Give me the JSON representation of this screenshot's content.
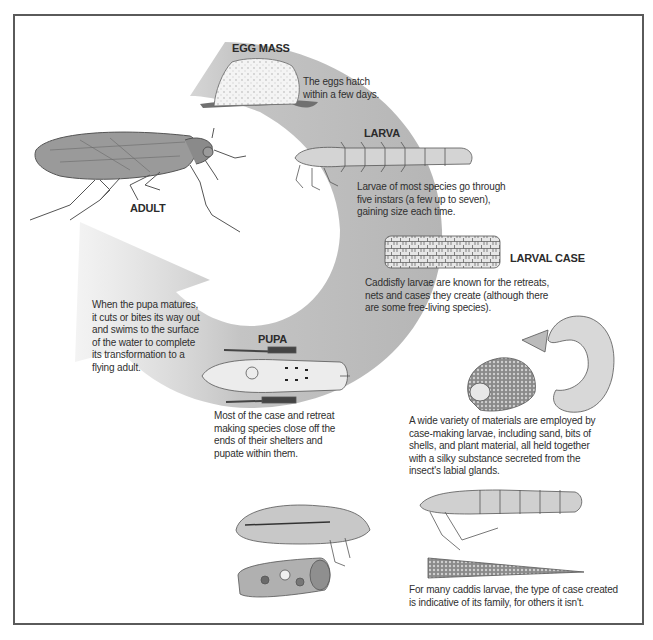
{
  "diagram": {
    "colors": {
      "cycle_arrow": "#b8b8b8",
      "frame_border": "#5a5a5a",
      "text": "#2f2f2f"
    },
    "stages": {
      "egg_mass": {
        "label": "EGG MASS",
        "caption": [
          "The eggs hatch",
          "within a few days."
        ]
      },
      "larva": {
        "label": "LARVA",
        "caption": [
          "Larvae of most species go through",
          "five instars (a few up to seven),",
          "gaining size each time."
        ]
      },
      "larval_case": {
        "label": "LARVAL CASE",
        "caption": [
          "Caddisfly larvae are known for the retreats,",
          "nets and cases they create (although there",
          "are some free-living species)."
        ]
      },
      "pupa": {
        "label": "PUPA",
        "caption": [
          "Most of the case and retreat",
          "making species close off the",
          "ends of their shelters and",
          "pupate within them."
        ]
      },
      "adult": {
        "label": "ADULT",
        "caption": [
          "When the pupa matures,",
          "it cuts or bites its way out",
          "and swims to the surface",
          "of the water to complete",
          "its transformation to a",
          "flying adult."
        ]
      }
    },
    "notes": {
      "case_materials": [
        "A wide variety of materials are employed by",
        "case-making larvae, including sand, bits of",
        "shells, and plant material, all held together",
        "with a silky substance secreted from the",
        "insect's labial glands."
      ],
      "case_family": [
        "For many caddis larvae, the type of case created",
        "is indicative of its family, for others it isn't."
      ]
    }
  }
}
